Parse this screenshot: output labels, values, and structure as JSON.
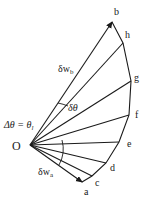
{
  "diagram": {
    "type": "velocity-polygon",
    "origin": {
      "label": "O",
      "x": 30,
      "y": 145
    },
    "points": [
      {
        "label": "a",
        "x": 82,
        "y": 182,
        "lx": 84,
        "ly": 195
      },
      {
        "label": "c",
        "x": 92,
        "y": 176,
        "lx": 95,
        "ly": 186
      },
      {
        "label": "d",
        "x": 106,
        "y": 163,
        "lx": 110,
        "ly": 171
      },
      {
        "label": "e",
        "x": 119,
        "y": 142,
        "lx": 127,
        "ly": 147
      },
      {
        "label": "f",
        "x": 129,
        "y": 115,
        "lx": 135,
        "ly": 118
      },
      {
        "label": "g",
        "x": 131,
        "y": 81,
        "lx": 134,
        "ly": 81
      },
      {
        "label": "h",
        "x": 123,
        "y": 43,
        "lx": 125,
        "ly": 38
      },
      {
        "label": "b",
        "x": 112,
        "y": 22,
        "lx": 114,
        "ly": 15
      }
    ],
    "labels": {
      "delta_w_b": "δw",
      "delta_w_b_sub": "b",
      "delta_w_a": "δw",
      "delta_w_a_sub": "a",
      "delta_theta": "δθ",
      "delta_theta_eq": "Δθ = θ",
      "delta_theta_eq_sub": "l",
      "origin": "O"
    },
    "colors": {
      "line": "#1a1a1a",
      "background": "#ffffff"
    }
  }
}
